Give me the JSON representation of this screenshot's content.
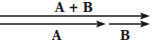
{
  "diagram": {
    "type": "vector-addition",
    "labels": {
      "sum": "A + B",
      "a": "A",
      "b": "B"
    },
    "vectors": [
      {
        "name": "A + B",
        "x1": 0,
        "x2": 150,
        "y": 16
      },
      {
        "name": "A",
        "x1": 0,
        "x2": 106,
        "y": 24
      },
      {
        "name": "B",
        "x1": 109,
        "x2": 150,
        "y": 24
      }
    ],
    "colors": {
      "stroke": "#1a1a1a",
      "background": "#ffffff"
    }
  }
}
